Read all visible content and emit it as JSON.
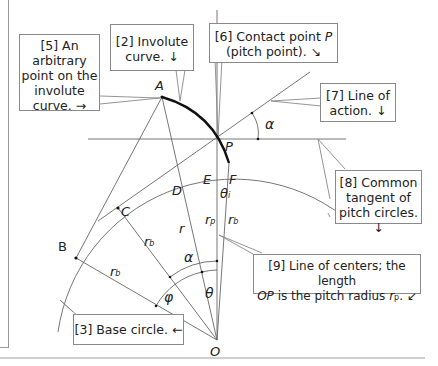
{
  "figure": {
    "points": {
      "A": "A",
      "B": "B",
      "C": "C",
      "D": "D",
      "E": "E",
      "F": "F",
      "P": "P",
      "O": "O"
    },
    "symbols": {
      "alpha_top": "α",
      "alpha_mid": "α",
      "phi": "φ",
      "theta": "θ",
      "theta_i": "θ",
      "theta_i_sub": "i",
      "r": "r",
      "r_b_1": "r",
      "r_b_2": "r",
      "r_b_3": "r",
      "r_p": "r",
      "sub_b": "b",
      "sub_p": "p"
    },
    "colors": {
      "line": "#555555",
      "involute": "#111111",
      "callout_border": "#8a8a8a",
      "text": "#222222"
    }
  },
  "callouts": [
    {
      "id": "5",
      "lines": [
        "[5] An",
        "arbitrary",
        "point on the",
        "involute",
        "curve. →"
      ]
    },
    {
      "id": "2",
      "lines": [
        "[2] Involute",
        "curve. ↓"
      ]
    },
    {
      "id": "6",
      "line1_prefix": "[6] Contact point ",
      "line1_italic": "P",
      "line2": "(pitch point). ↘"
    },
    {
      "id": "7",
      "lines": [
        "[7] Line of",
        "action. ↓"
      ]
    },
    {
      "id": "8",
      "lines": [
        "[8] Common",
        "tangent of",
        "pitch circles. ↓"
      ]
    },
    {
      "id": "9",
      "line1": "[9] Line of centers; the length",
      "line2_italic": "OP",
      "line2_mid": " is the pitch radius ",
      "line2_r": "r",
      "line2_sub": "p",
      "line2_end": ". ↙"
    },
    {
      "id": "3",
      "lines": [
        "[3] Base circle. ←"
      ]
    }
  ]
}
